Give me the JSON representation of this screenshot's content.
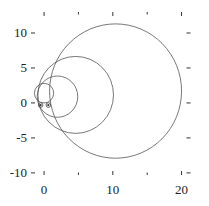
{
  "figure": {
    "annotation_label": "Fig. 6b"
  },
  "chart_data": {
    "type": "line",
    "title": "",
    "xlabel": "",
    "ylabel": "",
    "xlim": [
      -1.9,
      21.3
    ],
    "ylim": [
      -10.3,
      13.0
    ],
    "grid": false,
    "legend": "none",
    "x_major_ticks": [
      0,
      10,
      20
    ],
    "x_minor_ticks": [
      5,
      15
    ],
    "y_major_ticks": [
      -10,
      -5,
      0,
      5,
      10
    ],
    "x_tick_labels": [
      "0",
      "10",
      "20"
    ],
    "y_tick_labels": [
      "-10",
      "-5",
      "0",
      "5",
      "10"
    ],
    "circles": [
      {
        "name": "circle-large",
        "cx": 10.4,
        "cy": 1.7,
        "r": 9.6
      },
      {
        "name": "circle-medium",
        "cx": 4.6,
        "cy": 1.15,
        "r": 5.5
      },
      {
        "name": "circle-small",
        "cx": 1.95,
        "cy": 0.9,
        "r": 2.95
      },
      {
        "name": "circle-tiny",
        "cx": 0.0,
        "cy": 1.4,
        "r": 1.4
      }
    ],
    "markers": [
      {
        "x": -0.5,
        "y": -0.3,
        "style": "circle-dot"
      },
      {
        "x": 0.62,
        "y": -0.3,
        "style": "circle-dot"
      }
    ],
    "annotation": {
      "text": "Fig. 6b",
      "x": -0.8,
      "y": -8.6
    },
    "colors": {
      "curve": "#555555",
      "frame": "#333333",
      "text": "#222222",
      "background": "#ffffff"
    }
  }
}
